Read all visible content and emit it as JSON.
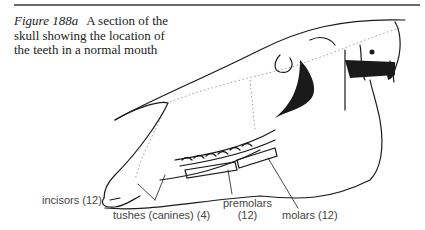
{
  "figure": {
    "number": "Figure 188a",
    "caption_lines": [
      "A section of the",
      "skull showing the location of",
      "the teeth in a normal mouth"
    ]
  },
  "labels": {
    "incisors": "incisors (12)",
    "tushes": "tushes (canines) (4)",
    "premolars_line1": "premolars",
    "premolars_line2": "(12)",
    "molars": "molars (12)"
  },
  "colors": {
    "ink": "#1a1a1a",
    "rule": "#6a6a6a",
    "label": "#444444"
  }
}
